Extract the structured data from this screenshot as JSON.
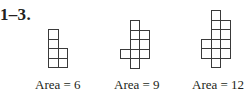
{
  "heading": "1–3.",
  "figures": [
    {
      "caption": "Area = 6",
      "cells": [
        [
          0,
          0
        ],
        [
          0,
          1
        ],
        [
          0,
          2
        ],
        [
          1,
          2
        ],
        [
          0,
          3
        ],
        [
          1,
          3
        ]
      ]
    },
    {
      "caption": "Area = 9",
      "cells": [
        [
          1,
          0
        ],
        [
          1,
          1
        ],
        [
          2,
          1
        ],
        [
          1,
          2
        ],
        [
          2,
          2
        ],
        [
          0,
          3
        ],
        [
          1,
          3
        ],
        [
          2,
          3
        ],
        [
          1,
          4
        ]
      ]
    },
    {
      "caption": "Area = 12",
      "cells": [
        [
          1,
          0
        ],
        [
          1,
          1
        ],
        [
          2,
          1
        ],
        [
          1,
          2
        ],
        [
          2,
          2
        ],
        [
          0,
          3
        ],
        [
          1,
          3
        ],
        [
          2,
          3
        ],
        [
          0,
          4
        ],
        [
          1,
          4
        ],
        [
          2,
          4
        ],
        [
          1,
          5
        ]
      ]
    }
  ],
  "style": {
    "line_color": "#3a3a3a",
    "text_color": "#231f20",
    "cell_size_px": 9.5
  }
}
